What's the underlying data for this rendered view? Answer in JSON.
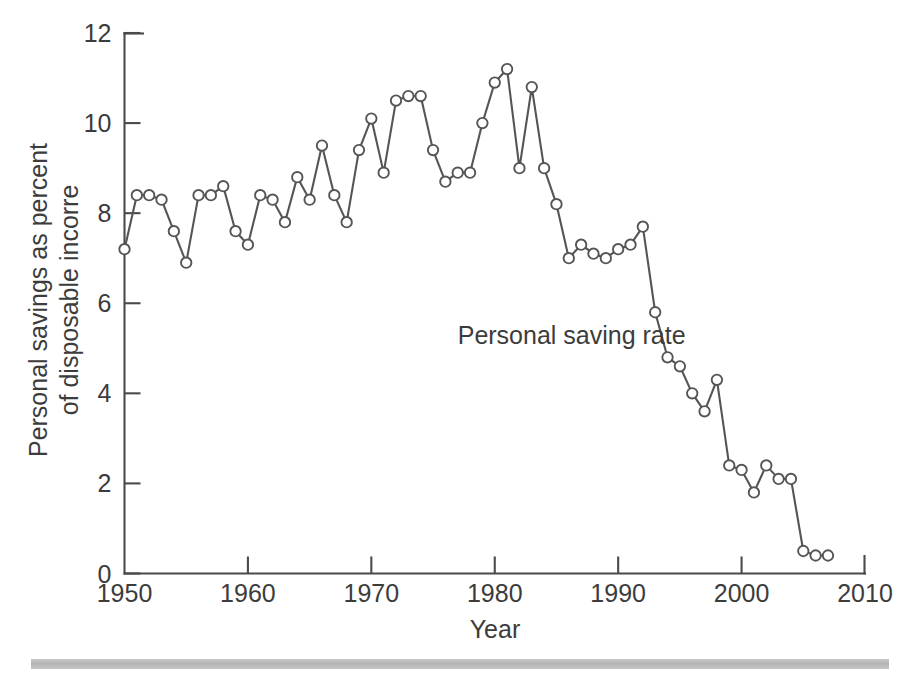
{
  "chart_data": {
    "type": "line",
    "title": "",
    "xlabel": "Year",
    "ylabel": "Personal savings as percent of disposable incorre",
    "ylabel_lines": [
      "Personal savings as percent",
      "of disposable incorre"
    ],
    "xlim": [
      1950,
      2010
    ],
    "ylim": [
      0,
      12
    ],
    "xticks": [
      1950,
      1960,
      1970,
      1980,
      1990,
      2000,
      2010
    ],
    "xticklabels": [
      "1950",
      "1960",
      "1970",
      "1980",
      "1990",
      "2000",
      "2010"
    ],
    "yticks": [
      0,
      2,
      4,
      6,
      8,
      10,
      12
    ],
    "yticklabels": [
      "0",
      "2",
      "4",
      "6",
      "8",
      "10",
      "12"
    ],
    "grid": false,
    "legend_position": "none",
    "annotations": [
      {
        "text": "Personal saving rate",
        "x": 1977.0,
        "y": 5.1
      }
    ],
    "marker": "open-circle",
    "line_color": "#555555",
    "marker_face_color": "#ffffff",
    "series": [
      {
        "name": "Personal saving rate",
        "x": [
          1950,
          1951,
          1952,
          1953,
          1954,
          1955,
          1956,
          1957,
          1958,
          1959,
          1960,
          1961,
          1962,
          1963,
          1964,
          1965,
          1966,
          1967,
          1968,
          1969,
          1970,
          1971,
          1972,
          1973,
          1974,
          1975,
          1976,
          1977,
          1978,
          1979,
          1980,
          1981,
          1982,
          1983,
          1984,
          1985,
          1986,
          1987,
          1988,
          1989,
          1990,
          1991,
          1992,
          1993,
          1994,
          1995,
          1996,
          1997,
          1998,
          1999,
          2000,
          2001,
          2002,
          2003,
          2004,
          2005,
          2006,
          2007
        ],
        "values": [
          7.2,
          8.4,
          8.4,
          8.3,
          7.6,
          6.9,
          8.4,
          8.4,
          8.6,
          7.6,
          7.3,
          8.4,
          8.3,
          7.8,
          8.8,
          8.3,
          9.5,
          8.4,
          7.8,
          9.4,
          10.1,
          8.9,
          10.5,
          10.6,
          10.6,
          9.4,
          8.7,
          8.9,
          8.9,
          10.0,
          10.9,
          11.2,
          9.0,
          10.8,
          9.0,
          8.2,
          7.0,
          7.3,
          7.1,
          7.0,
          7.2,
          7.3,
          7.7,
          5.8,
          4.8,
          4.6,
          4.0,
          3.6,
          4.3,
          2.4,
          2.3,
          1.8,
          2.4,
          2.1,
          2.1,
          0.5,
          0.4,
          0.4
        ]
      }
    ]
  },
  "axis": {
    "x_title": "Year",
    "y_title_line1": "Personal savings as percent",
    "y_title_line2": "of disposable incorre"
  },
  "annotation": {
    "series_label": "Personal saving rate"
  }
}
